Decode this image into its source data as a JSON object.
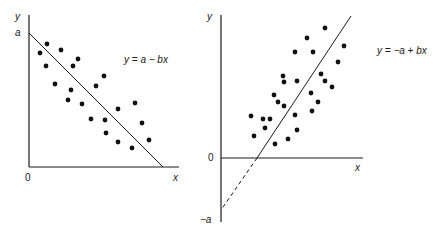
{
  "left_panel": {
    "y_axis_label": "y",
    "x_axis_label": "x",
    "origin_label": "0",
    "intercept_label": "a",
    "equation": "y = a − bx",
    "relationship": "negative",
    "points": [
      [
        40,
        53
      ],
      [
        47,
        44
      ],
      [
        61,
        50
      ],
      [
        46,
        66
      ],
      [
        78,
        59
      ],
      [
        73,
        66
      ],
      [
        55,
        84
      ],
      [
        71,
        90
      ],
      [
        104,
        76
      ],
      [
        96,
        86
      ],
      [
        68,
        100
      ],
      [
        82,
        104
      ],
      [
        118,
        109
      ],
      [
        135,
        103
      ],
      [
        91,
        119
      ],
      [
        105,
        120
      ],
      [
        142,
        123
      ],
      [
        106,
        133
      ],
      [
        118,
        142
      ],
      [
        132,
        148
      ],
      [
        149,
        140
      ]
    ]
  },
  "right_panel": {
    "y_axis_label": "y",
    "x_axis_label": "x",
    "origin_label": "0",
    "intercept_label": "−a",
    "equation": "y = −a + bx",
    "relationship": "positive",
    "points": [
      [
        325,
        28
      ],
      [
        307,
        38
      ],
      [
        295,
        52
      ],
      [
        313,
        52
      ],
      [
        344,
        46
      ],
      [
        338,
        62
      ],
      [
        283,
        76
      ],
      [
        284,
        82
      ],
      [
        297,
        81
      ],
      [
        321,
        74
      ],
      [
        325,
        81
      ],
      [
        332,
        87
      ],
      [
        274,
        95
      ],
      [
        311,
        93
      ],
      [
        278,
        102
      ],
      [
        284,
        106
      ],
      [
        318,
        102
      ],
      [
        295,
        115
      ],
      [
        312,
        111
      ],
      [
        251,
        116
      ],
      [
        263,
        119
      ],
      [
        270,
        119
      ],
      [
        265,
        128
      ],
      [
        297,
        130
      ],
      [
        254,
        136
      ],
      [
        288,
        139
      ],
      [
        275,
        144
      ]
    ]
  },
  "colors": {
    "ink": "#1a1a1a",
    "background": "#ffffff"
  }
}
